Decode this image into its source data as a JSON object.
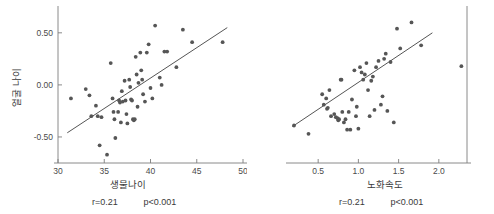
{
  "figure": {
    "background": "#ffffff",
    "dot_color": "#565656",
    "line_color": "#555555",
    "axis_color": "#7d7d7d"
  },
  "chart_data": [
    {
      "id": "left",
      "type": "scatter",
      "title": "",
      "xlabel": "생물나이",
      "ylabel": "얼굴 나이",
      "xlim": [
        30.0,
        50.0
      ],
      "ylim": [
        -0.75,
        0.7
      ],
      "xticks": [
        "30",
        "35",
        "40",
        "45",
        "50"
      ],
      "xtick_values": [
        30,
        35,
        40,
        45,
        50
      ],
      "yticks": [
        "0.50",
        "0.00",
        "-0.50"
      ],
      "ytick_values": [
        0.5,
        0.0,
        -0.5
      ],
      "grid": false,
      "legend": "none",
      "annotations": {
        "r": "r=0.21",
        "p": "p<0.001"
      },
      "fit_line": {
        "x": [
          31.0,
          48.3
        ],
        "y": [
          -0.46,
          0.55
        ]
      },
      "points": [
        {
          "x": 31.4,
          "y": -0.13
        },
        {
          "x": 33.0,
          "y": -0.04
        },
        {
          "x": 33.4,
          "y": -0.1
        },
        {
          "x": 33.6,
          "y": -0.3
        },
        {
          "x": 34.1,
          "y": -0.2
        },
        {
          "x": 34.3,
          "y": -0.3
        },
        {
          "x": 34.5,
          "y": -0.58
        },
        {
          "x": 34.7,
          "y": -0.31
        },
        {
          "x": 35.3,
          "y": -0.67
        },
        {
          "x": 35.7,
          "y": 0.21
        },
        {
          "x": 35.9,
          "y": -0.13
        },
        {
          "x": 36.0,
          "y": -0.26
        },
        {
          "x": 36.1,
          "y": -0.33
        },
        {
          "x": 36.2,
          "y": -0.51
        },
        {
          "x": 36.5,
          "y": -0.26
        },
        {
          "x": 36.6,
          "y": -0.15
        },
        {
          "x": 36.7,
          "y": -0.17
        },
        {
          "x": 36.8,
          "y": -0.36
        },
        {
          "x": 36.9,
          "y": -0.06
        },
        {
          "x": 37.0,
          "y": -0.16
        },
        {
          "x": 37.2,
          "y": 0.04
        },
        {
          "x": 37.3,
          "y": -0.15
        },
        {
          "x": 37.4,
          "y": -0.28
        },
        {
          "x": 37.5,
          "y": -0.37
        },
        {
          "x": 37.7,
          "y": 0.05
        },
        {
          "x": 37.8,
          "y": -0.02
        },
        {
          "x": 37.9,
          "y": -0.14
        },
        {
          "x": 38.0,
          "y": -0.15
        },
        {
          "x": 38.1,
          "y": -0.33
        },
        {
          "x": 38.2,
          "y": -0.34
        },
        {
          "x": 38.3,
          "y": -0.33
        },
        {
          "x": 38.4,
          "y": 0.27
        },
        {
          "x": 38.5,
          "y": 0.1
        },
        {
          "x": 38.6,
          "y": -0.21
        },
        {
          "x": 38.7,
          "y": 0.02
        },
        {
          "x": 38.9,
          "y": 0.31
        },
        {
          "x": 39.0,
          "y": 0.14
        },
        {
          "x": 39.1,
          "y": 0.05
        },
        {
          "x": 39.2,
          "y": -0.09
        },
        {
          "x": 39.4,
          "y": -0.16
        },
        {
          "x": 39.6,
          "y": 0.31
        },
        {
          "x": 39.8,
          "y": 0.39
        },
        {
          "x": 40.0,
          "y": -0.03
        },
        {
          "x": 40.2,
          "y": -0.13
        },
        {
          "x": 40.5,
          "y": 0.57
        },
        {
          "x": 41.0,
          "y": 0.07
        },
        {
          "x": 41.2,
          "y": 0.0
        },
        {
          "x": 41.5,
          "y": 0.32
        },
        {
          "x": 41.8,
          "y": 0.32
        },
        {
          "x": 42.8,
          "y": 0.17
        },
        {
          "x": 43.5,
          "y": 0.53
        },
        {
          "x": 44.5,
          "y": 0.41
        },
        {
          "x": 47.8,
          "y": 0.41
        }
      ]
    },
    {
      "id": "right",
      "type": "scatter",
      "title": "",
      "xlabel": "노화속도",
      "ylabel": "",
      "xlim": [
        0.15,
        2.35
      ],
      "ylim": [
        -0.75,
        0.7
      ],
      "xticks": [
        "0.5",
        "1.0",
        "1.5",
        "2.0"
      ],
      "xtick_values": [
        0.5,
        1.0,
        1.5,
        2.0
      ],
      "yticks": [],
      "ytick_values": [],
      "grid": false,
      "legend": "none",
      "annotations": {
        "r": "r=0.21",
        "p": "p<0.001"
      },
      "fit_line": {
        "x": [
          0.18,
          1.92
        ],
        "y": [
          -0.4,
          0.5
        ]
      },
      "points": [
        {
          "x": 0.2,
          "y": -0.39
        },
        {
          "x": 0.38,
          "y": -0.47
        },
        {
          "x": 0.55,
          "y": -0.09
        },
        {
          "x": 0.57,
          "y": -0.19
        },
        {
          "x": 0.6,
          "y": -0.13
        },
        {
          "x": 0.61,
          "y": -0.23
        },
        {
          "x": 0.62,
          "y": -0.22
        },
        {
          "x": 0.64,
          "y": -0.05
        },
        {
          "x": 0.66,
          "y": -0.3
        },
        {
          "x": 0.7,
          "y": -0.28
        },
        {
          "x": 0.72,
          "y": -0.31
        },
        {
          "x": 0.74,
          "y": -0.32
        },
        {
          "x": 0.75,
          "y": -0.34
        },
        {
          "x": 0.76,
          "y": -0.33
        },
        {
          "x": 0.78,
          "y": 0.05
        },
        {
          "x": 0.79,
          "y": 0.05
        },
        {
          "x": 0.8,
          "y": -0.26
        },
        {
          "x": 0.82,
          "y": -0.36
        },
        {
          "x": 0.84,
          "y": -0.33
        },
        {
          "x": 0.86,
          "y": -0.43
        },
        {
          "x": 0.88,
          "y": -0.26
        },
        {
          "x": 0.9,
          "y": -0.43
        },
        {
          "x": 0.92,
          "y": -0.14
        },
        {
          "x": 0.95,
          "y": 0.14
        },
        {
          "x": 0.97,
          "y": -0.3
        },
        {
          "x": 0.98,
          "y": -0.21
        },
        {
          "x": 1.0,
          "y": -0.42
        },
        {
          "x": 1.02,
          "y": 0.17
        },
        {
          "x": 1.04,
          "y": 0.12
        },
        {
          "x": 1.06,
          "y": 0.05
        },
        {
          "x": 1.08,
          "y": 0.1
        },
        {
          "x": 1.1,
          "y": 0.21
        },
        {
          "x": 1.12,
          "y": -0.05
        },
        {
          "x": 1.14,
          "y": -0.3
        },
        {
          "x": 1.16,
          "y": 0.04
        },
        {
          "x": 1.18,
          "y": 0.08
        },
        {
          "x": 1.2,
          "y": -0.24
        },
        {
          "x": 1.22,
          "y": 0.17
        },
        {
          "x": 1.25,
          "y": 0.23
        },
        {
          "x": 1.28,
          "y": -0.19
        },
        {
          "x": 1.3,
          "y": -0.11
        },
        {
          "x": 1.32,
          "y": 0.25
        },
        {
          "x": 1.34,
          "y": 0.3
        },
        {
          "x": 1.36,
          "y": -0.25
        },
        {
          "x": 1.4,
          "y": 0.22
        },
        {
          "x": 1.44,
          "y": -0.36
        },
        {
          "x": 1.48,
          "y": 0.54
        },
        {
          "x": 1.52,
          "y": 0.35
        },
        {
          "x": 1.66,
          "y": 0.6
        },
        {
          "x": 1.78,
          "y": 0.38
        },
        {
          "x": 2.28,
          "y": 0.18
        }
      ]
    }
  ]
}
